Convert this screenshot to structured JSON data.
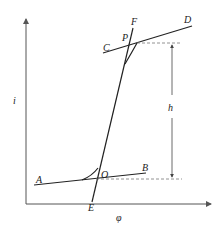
{
  "diagram": {
    "axes": {
      "x_label": "φ",
      "y_label": "i"
    },
    "points": {
      "A": "A",
      "B": "B",
      "C": "C",
      "D": "D",
      "E": "E",
      "F": "F",
      "O": "O",
      "P": "P"
    },
    "dimension_label": "h",
    "colors": {
      "line": "#222222",
      "axis": "#555555",
      "dashed": "#777777"
    }
  }
}
